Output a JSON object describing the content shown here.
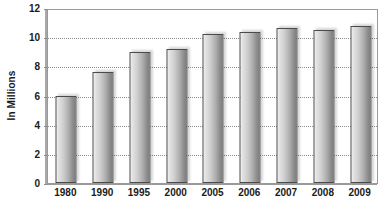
{
  "chart_data": {
    "type": "bar",
    "title": "",
    "subtitle": "",
    "xlabel": "",
    "ylabel": "In Millions",
    "categories": [
      "1980",
      "1990",
      "1995",
      "2000",
      "2005",
      "2006",
      "2007",
      "2008",
      "2009"
    ],
    "values": [
      6.0,
      7.6,
      9.0,
      9.2,
      10.2,
      10.35,
      10.6,
      10.5,
      10.75
    ],
    "series": [
      {
        "name": "In Millions",
        "values": [
          6.0,
          7.6,
          9.0,
          9.2,
          10.2,
          10.35,
          10.6,
          10.5,
          10.75
        ]
      }
    ],
    "ylim": [
      0,
      12
    ],
    "ytick_values": [
      0,
      2,
      4,
      6,
      8,
      10,
      12
    ],
    "ytick_labels": [
      "0",
      "2",
      "4",
      "6",
      "8",
      "10",
      "12"
    ],
    "grid": true,
    "grid_axis": "y",
    "grid_style": "dotted",
    "legend": false,
    "legend_position": "none",
    "annotations": [],
    "colors": {
      "bar_fill_light": "#f2f2f2",
      "bar_fill_dark": "#7d7d7d",
      "bar_border": "#4a4a4a",
      "gridline": "#8f8f8f",
      "frame": "#9a9a9a",
      "text": "#1a1a1a",
      "background": "#ffffff"
    }
  }
}
